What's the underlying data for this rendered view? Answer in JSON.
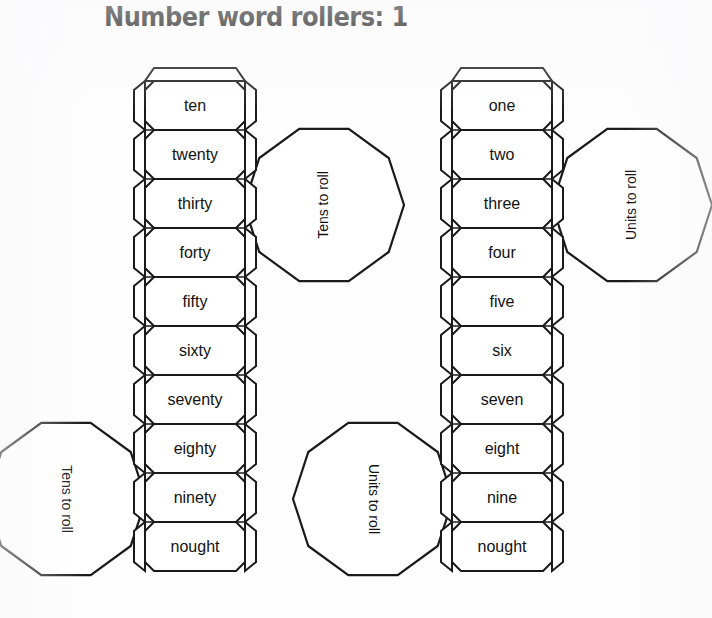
{
  "page": {
    "title": "Number word rollers: 1",
    "background_color": "#fdfdfd",
    "ink_color": "#1a1a1a"
  },
  "rollers": [
    {
      "id": "tens-roller",
      "name": "tens",
      "x": 145,
      "top": 81,
      "width": 100,
      "cell_height": 49,
      "cells": [
        {
          "label": "ten"
        },
        {
          "label": "twenty"
        },
        {
          "label": "thirty"
        },
        {
          "label": "forty"
        },
        {
          "label": "fifty"
        },
        {
          "label": "sixty"
        },
        {
          "label": "seventy"
        },
        {
          "label": "eighty"
        },
        {
          "label": "ninety"
        },
        {
          "label": "nought"
        }
      ]
    },
    {
      "id": "units-roller",
      "name": "units",
      "x": 452,
      "top": 81,
      "width": 100,
      "cell_height": 49,
      "cells": [
        {
          "label": "one"
        },
        {
          "label": "two"
        },
        {
          "label": "three"
        },
        {
          "label": "four"
        },
        {
          "label": "five"
        },
        {
          "label": "six"
        },
        {
          "label": "seven"
        },
        {
          "label": "eight"
        },
        {
          "label": "nine"
        },
        {
          "label": "nought"
        }
      ]
    }
  ],
  "end_caps": [
    {
      "id": "tens-cap-top",
      "label": "Tens to roll",
      "cx": 324,
      "cy": 205,
      "r": 80,
      "rotation": -90
    },
    {
      "id": "units-cap-top",
      "label": "Units to roll",
      "cx": 632,
      "cy": 205,
      "r": 80,
      "rotation": -90
    },
    {
      "id": "tens-cap-bottom",
      "label": "Tens to roll",
      "cx": 66,
      "cy": 499,
      "r": 80,
      "rotation": 90
    },
    {
      "id": "units-cap-bottom",
      "label": "Units to roll",
      "cx": 373,
      "cy": 499,
      "r": 80,
      "rotation": 90
    }
  ]
}
